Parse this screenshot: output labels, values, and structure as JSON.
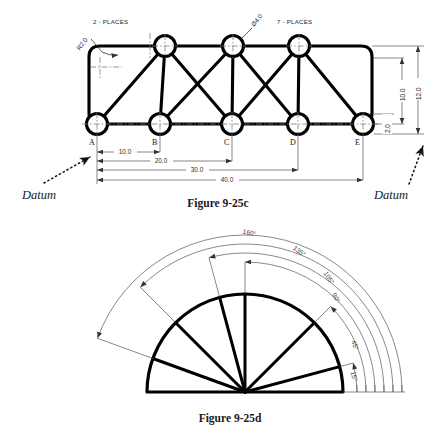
{
  "page": {
    "background": "#ffffff",
    "ink": "#000000",
    "thin_ink": "#555555"
  },
  "figure_c": {
    "caption": "Figure 9-25c",
    "datum_left_label": "Datum",
    "datum_right_label": "Datum",
    "notes": {
      "radius_note_count": "2 - PLACES",
      "radius_value": "R2.0",
      "hole_note_count": "7 - PLACES",
      "hole_value": "Ø4.0"
    },
    "node_labels": [
      "A",
      "B",
      "C",
      "D",
      "E"
    ],
    "horizontal_dimensions": [
      "10.0",
      "20.0",
      "30.0",
      "40.0"
    ],
    "vertical_dimensions": [
      "2.0",
      "10.0",
      "12.0"
    ],
    "geometry": {
      "bottom_nodes_x": [
        97,
        160,
        232,
        298,
        363
      ],
      "bottom_node_y": 124,
      "top_nodes_x": [
        165,
        233,
        299
      ],
      "top_node_y": 46,
      "hole_radius": 10.5,
      "plate_left": 89,
      "plate_right": 372,
      "plate_top": 46,
      "plate_bottom": 124,
      "corner_radius": 11
    }
  },
  "figure_d": {
    "caption": "Figure 9-25d",
    "angles": [
      "160°",
      "135°",
      "105°",
      "90°",
      "45°",
      "15°"
    ],
    "angle_values": [
      160,
      135,
      105,
      90,
      45,
      15
    ],
    "geometry": {
      "center_x": 245,
      "center_y": 392,
      "body_radius": 98,
      "arc_radii": [
        112,
        121,
        130,
        139,
        148,
        157
      ]
    }
  }
}
